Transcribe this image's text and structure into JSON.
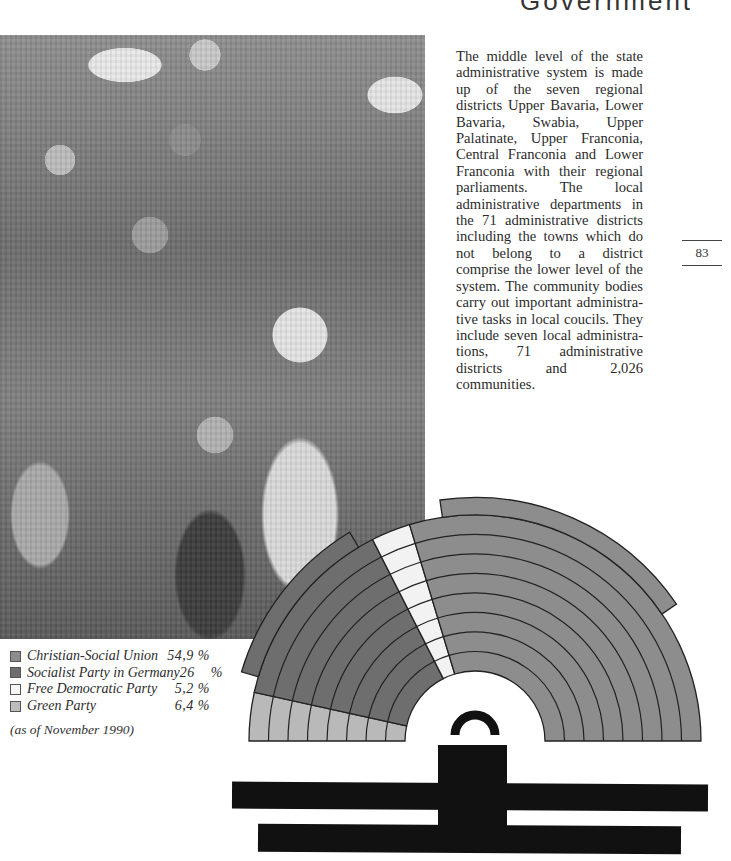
{
  "header": {
    "fragment": "Government"
  },
  "photo": {
    "description": "black-and-white photograph of a crowd of people, some under umbrellas"
  },
  "body_text": "The middle level of the state ad­ministrative system is made up of the seven regional districts Upper Bavaria, Lower Bavaria, Swabia, Upper Palatinate, Upper Franco­nia, Central Franconia and Lower Franconia with their regional par­liaments. The local administrative departments in the 71 administra­tive districts including the towns which do not belong to a district comprise the lower level of the system. The community bodies carry out important administra­tive tasks in local coucils. They in­clude seven local administra­tions, 71 administrative districts and 2,026 communities.",
  "page_number": "83",
  "chart_data": {
    "type": "pie",
    "subtype": "parliament-semicircle",
    "title": "",
    "categories": [
      "Green Party",
      "Socialist Party in Germany",
      "Free Democratic Party",
      "Christian-Social Union"
    ],
    "values": [
      6.4,
      26,
      5.2,
      54.9
    ],
    "unit": "%",
    "colors": {
      "Christian-Social Union": "#8d8d8d",
      "Socialist Party in Germany": "#6e6e6e",
      "Free Democratic Party": "#f2f2f2",
      "Green Party": "#b9b9b9"
    },
    "legend": [
      {
        "label": "Christian-Social Union",
        "value": "54,9 %",
        "color": "#8d8d8d"
      },
      {
        "label": "Socialist Party in Germany",
        "value": "26    %",
        "color": "#6e6e6e"
      },
      {
        "label": "Free Democratic Party",
        "value": "5,2 %",
        "color": "#f6f6f6"
      },
      {
        "label": "Green Party",
        "value": "6,4 %",
        "color": "#bdbdbd"
      }
    ],
    "legend_position": "bottom-left",
    "note": "(as of November 1990)"
  }
}
